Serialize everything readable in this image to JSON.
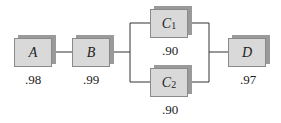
{
  "diagram": {
    "type": "reliability block diagram",
    "components": [
      {
        "id": "A",
        "name": "A",
        "sub": "",
        "reliability": ".98"
      },
      {
        "id": "B",
        "name": "B",
        "sub": "",
        "reliability": ".99"
      },
      {
        "id": "C1",
        "name": "C",
        "sub": "1",
        "reliability": ".90"
      },
      {
        "id": "C2",
        "name": "C",
        "sub": "2",
        "reliability": ".90"
      },
      {
        "id": "D",
        "name": "D",
        "sub": "",
        "reliability": ".97"
      }
    ],
    "connections": [
      [
        "A",
        "B"
      ],
      [
        "B",
        "C1"
      ],
      [
        "B",
        "C2"
      ],
      [
        "C1",
        "D"
      ],
      [
        "C2",
        "D"
      ]
    ],
    "colors": {
      "box_face": "#d9d9d9",
      "box_shadow": "#9a9a9a",
      "line": "#333333"
    }
  }
}
